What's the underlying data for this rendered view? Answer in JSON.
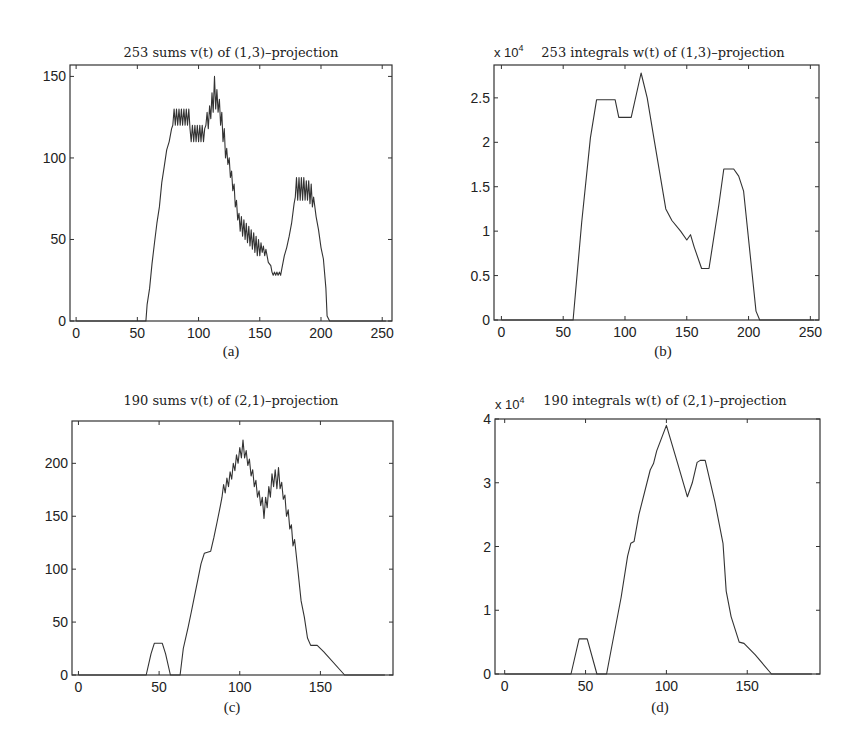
{
  "figure": {
    "panels": [
      {
        "id": "a",
        "title": "253 sums v(t) of (1,3)–projection",
        "caption": "(a)",
        "exponent_label": "",
        "box": {
          "left": 70,
          "top": 65,
          "right": 392,
          "bottom": 321
        },
        "xlim": [
          -5,
          258
        ],
        "ylim": [
          0,
          157
        ],
        "xticks": [
          0,
          50,
          100,
          150,
          200,
          250
        ],
        "yticks": [
          0,
          50,
          100,
          150
        ],
        "ytick_labels": [
          "0",
          "50",
          "100",
          "150"
        ]
      },
      {
        "id": "b",
        "title": "253 integrals w(t) of (1,3)–projection",
        "caption": "(b)",
        "exponent_label": "x 10",
        "exponent_power": "4",
        "box": {
          "left": 494,
          "top": 65,
          "right": 819,
          "bottom": 320
        },
        "xlim": [
          -6,
          257
        ],
        "ylim": [
          0,
          2.87
        ],
        "xticks": [
          0,
          50,
          100,
          150,
          200,
          250
        ],
        "yticks": [
          0,
          0.5,
          1,
          1.5,
          2,
          2.5
        ],
        "ytick_labels": [
          "0",
          "0.5",
          "1",
          "1.5",
          "2",
          "2.5"
        ]
      },
      {
        "id": "c",
        "title": "190 sums v(t) of (2,1)–projection",
        "caption": "(c)",
        "exponent_label": "",
        "box": {
          "left": 72,
          "top": 421,
          "right": 393,
          "bottom": 675
        },
        "xlim": [
          -4,
          195
        ],
        "ylim": [
          0,
          240
        ],
        "xticks": [
          0,
          50,
          100,
          150
        ],
        "yticks": [
          0,
          50,
          100,
          150,
          200
        ],
        "ytick_labels": [
          "0",
          "50",
          "100",
          "150",
          "200"
        ]
      },
      {
        "id": "d",
        "title": "190 integrals w(t) of (2,1)–projection",
        "caption": "(d)",
        "exponent_label": "x 10",
        "exponent_power": "4",
        "box": {
          "left": 495,
          "top": 419,
          "right": 820,
          "bottom": 674
        },
        "xlim": [
          -6,
          195
        ],
        "ylim": [
          0,
          4
        ],
        "xticks": [
          0,
          50,
          100,
          150
        ],
        "yticks": [
          0,
          1,
          2,
          3,
          4
        ],
        "ytick_labels": [
          "0",
          "1",
          "2",
          "3",
          "4"
        ]
      }
    ]
  },
  "chart_data": [
    {
      "type": "line",
      "title": "253 sums v(t) of (1,3)–projection",
      "caption": "(a)",
      "xlabel": "",
      "ylabel": "",
      "xlim": [
        -5,
        258
      ],
      "ylim": [
        0,
        157
      ],
      "grid": false,
      "x": [
        0,
        57,
        58,
        60,
        62,
        64,
        66,
        68,
        70,
        72,
        74,
        76,
        78,
        79,
        80,
        81,
        82,
        83,
        84,
        85,
        86,
        87,
        88,
        89,
        90,
        91,
        92,
        93,
        94,
        95,
        96,
        97,
        98,
        99,
        100,
        101,
        102,
        103,
        104,
        105,
        106,
        107,
        108,
        109,
        110,
        111,
        112,
        113,
        114,
        115,
        116,
        117,
        118,
        119,
        120,
        121,
        122,
        123,
        124,
        125,
        126,
        127,
        128,
        129,
        130,
        131,
        132,
        133,
        134,
        135,
        136,
        137,
        138,
        139,
        140,
        141,
        142,
        143,
        144,
        145,
        146,
        147,
        148,
        149,
        150,
        151,
        152,
        153,
        154,
        155,
        157,
        159,
        160,
        161,
        162,
        163,
        164,
        165,
        166,
        167,
        168,
        170,
        172,
        174,
        176,
        178,
        179,
        180,
        181,
        182,
        183,
        184,
        185,
        186,
        187,
        188,
        189,
        190,
        191,
        192,
        193,
        194,
        196,
        198,
        200,
        202,
        204,
        205,
        207,
        253
      ],
      "values": [
        0,
        0,
        10,
        20,
        35,
        48,
        60,
        70,
        85,
        95,
        105,
        110,
        118,
        120,
        130,
        120,
        130,
        120,
        130,
        120,
        130,
        120,
        130,
        120,
        130,
        120,
        130,
        118,
        110,
        120,
        110,
        120,
        110,
        120,
        110,
        120,
        110,
        120,
        110,
        118,
        120,
        128,
        118,
        132,
        124,
        140,
        128,
        150,
        130,
        142,
        128,
        136,
        120,
        128,
        110,
        118,
        100,
        106,
        96,
        100,
        88,
        92,
        80,
        84,
        70,
        74,
        62,
        66,
        55,
        64,
        52,
        62,
        50,
        60,
        48,
        58,
        46,
        56,
        44,
        54,
        42,
        52,
        40,
        50,
        40,
        48,
        42,
        46,
        40,
        44,
        36,
        34,
        30,
        28,
        30,
        28,
        30,
        28,
        30,
        28,
        32,
        40,
        45,
        52,
        60,
        72,
        76,
        88,
        74,
        88,
        74,
        88,
        74,
        88,
        74,
        86,
        74,
        86,
        72,
        84,
        70,
        76,
        64,
        56,
        45,
        38,
        20,
        3,
        0,
        0
      ]
    },
    {
      "type": "line",
      "title": "253 integrals w(t) of (1,3)–projection",
      "caption": "(b)",
      "xlabel": "",
      "ylabel": "",
      "y_scale_label": "x 10^4",
      "xlim": [
        -6,
        257
      ],
      "ylim": [
        0,
        2.87
      ],
      "grid": false,
      "x": [
        0,
        58,
        65,
        72,
        77,
        92,
        95,
        105,
        113,
        118,
        124,
        133,
        138,
        145,
        150,
        153,
        156,
        162,
        168,
        176,
        180,
        188,
        192,
        196,
        206,
        209,
        253
      ],
      "values": [
        0,
        0,
        1.1,
        2.05,
        2.48,
        2.48,
        2.28,
        2.28,
        2.78,
        2.5,
        2.0,
        1.25,
        1.12,
        1.0,
        0.9,
        0.96,
        0.82,
        0.58,
        0.58,
        1.3,
        1.7,
        1.7,
        1.62,
        1.45,
        0.1,
        0,
        0
      ]
    },
    {
      "type": "line",
      "title": "190 sums v(t) of (2,1)–projection",
      "caption": "(c)",
      "xlabel": "",
      "ylabel": "",
      "xlim": [
        -4,
        195
      ],
      "ylim": [
        0,
        240
      ],
      "grid": false,
      "x": [
        0,
        42,
        45,
        47,
        52,
        54,
        57,
        63,
        65,
        68,
        70,
        72,
        74,
        76,
        78,
        82,
        84,
        86,
        88,
        89,
        90,
        91,
        92,
        93,
        94,
        95,
        96,
        97,
        98,
        99,
        100,
        101,
        102,
        103,
        104,
        105,
        106,
        107,
        108,
        109,
        110,
        111,
        112,
        113,
        114,
        115,
        116,
        117,
        118,
        119,
        120,
        121,
        122,
        123,
        124,
        125,
        126,
        127,
        128,
        129,
        130,
        131,
        132,
        133,
        134,
        136,
        138,
        140,
        142,
        144,
        148,
        152,
        165,
        190
      ],
      "values": [
        0,
        0,
        20,
        30,
        30,
        20,
        0,
        0,
        25,
        45,
        60,
        75,
        90,
        105,
        115,
        117,
        130,
        145,
        160,
        168,
        180,
        172,
        186,
        178,
        192,
        185,
        200,
        193,
        208,
        200,
        215,
        205,
        222,
        205,
        212,
        198,
        204,
        188,
        194,
        178,
        184,
        168,
        174,
        160,
        168,
        148,
        168,
        158,
        178,
        168,
        190,
        178,
        194,
        176,
        196,
        176,
        182,
        166,
        170,
        150,
        156,
        138,
        142,
        122,
        128,
        100,
        70,
        55,
        35,
        28,
        28,
        22,
        0,
        0
      ]
    },
    {
      "type": "line",
      "title": "190 integrals w(t) of (2,1)–projection",
      "caption": "(d)",
      "xlabel": "",
      "ylabel": "",
      "y_scale_label": "x 10^4",
      "xlim": [
        -6,
        195
      ],
      "ylim": [
        0,
        4
      ],
      "grid": false,
      "x": [
        0,
        41,
        46,
        51,
        57,
        63,
        66,
        72,
        76,
        78,
        80,
        83,
        90,
        92,
        94,
        100,
        107,
        113,
        116,
        119,
        121,
        124,
        130,
        135,
        137,
        140,
        145,
        148,
        155,
        165,
        190
      ],
      "values": [
        0,
        0,
        0.55,
        0.55,
        0,
        0,
        0.4,
        1.2,
        1.85,
        2.05,
        2.08,
        2.5,
        3.2,
        3.3,
        3.5,
        3.9,
        3.3,
        2.78,
        3.0,
        3.32,
        3.35,
        3.35,
        2.7,
        2.05,
        1.3,
        0.9,
        0.5,
        0.48,
        0.3,
        0,
        0
      ]
    }
  ]
}
